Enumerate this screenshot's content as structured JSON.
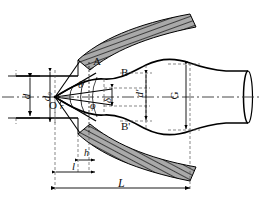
{
  "figure": {
    "type": "engineering-cross-section-diagram",
    "background_color": "#ffffff",
    "line_color": "#000000",
    "hatch_fill_color": "#a8a8a8",
    "centerline_style": "dash-dot"
  },
  "labels": {
    "origin": "O",
    "radius": "r",
    "inlet_diameter": "d",
    "initial_diameter": "d₀",
    "half_angle_theta": "θ",
    "half_angle_phi": "φ",
    "tool_upper": "A",
    "profile_upper": "B",
    "profile_lower": "B'",
    "gap_delta": "δ",
    "bulge_diameter": "d'",
    "outer_diameter": "G",
    "height_h": "h",
    "length_l": "l",
    "length_L": "L"
  },
  "dimensions": [
    {
      "name": "d",
      "orientation": "vertical",
      "note": "inlet tube diameter at left"
    },
    {
      "name": "d₀",
      "orientation": "vertical",
      "note": "initial blank diameter at apex"
    },
    {
      "name": "d'",
      "orientation": "vertical",
      "note": "bulged section diameter"
    },
    {
      "name": "G",
      "orientation": "vertical",
      "note": "overall outer diameter of formed part"
    },
    {
      "name": "δ",
      "orientation": "vertical",
      "note": "small clearance / wall offset"
    },
    {
      "name": "h",
      "orientation": "horizontal",
      "note": "short axial distance"
    },
    {
      "name": "l",
      "orientation": "horizontal",
      "note": "axial length from datum"
    },
    {
      "name": "L",
      "orientation": "horizontal",
      "note": "total axial length"
    }
  ],
  "angles": [
    {
      "name": "θ",
      "note": "upper cone half angle at apex O"
    },
    {
      "name": "φ",
      "note": "lower cone half angle at apex O"
    },
    {
      "name": "r",
      "note": "fillet radius at apex O"
    }
  ],
  "regions": [
    {
      "name": "A",
      "note": "upper hatched die jaw"
    },
    {
      "name": "B",
      "note": "upper formed profile curve"
    },
    {
      "name": "B'",
      "note": "lower formed profile curve"
    }
  ]
}
